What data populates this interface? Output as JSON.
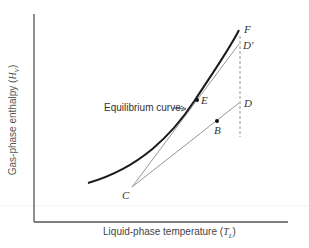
{
  "diagram": {
    "title": "",
    "x_axis": {
      "label_text": "Liquid-phase temperature (",
      "label_symbol": "T",
      "label_subscript": "L",
      "label_close": ")"
    },
    "y_axis": {
      "label_text": "Gas-phase enthalpy (",
      "label_symbol": "H",
      "label_subscript": "V",
      "label_close": ")"
    },
    "annotation": {
      "text": "Equilibrium curve",
      "arrow": "→"
    },
    "points": {
      "F": "F",
      "D_prime": "D′",
      "E": "E",
      "D": "D",
      "B": "B",
      "C": "C"
    },
    "colors": {
      "curve": "#1a1a1a",
      "lines": "#8a8a8a",
      "axes": "#555555",
      "dashed": "#888888"
    }
  }
}
